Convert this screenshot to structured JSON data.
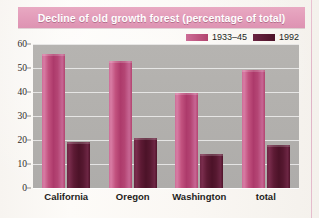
{
  "figure": {
    "title": "Decline of old growth forest (percentage of total)",
    "title_band_color": "#e49ebb",
    "plot_background": "#b3b1ae",
    "page_background": "#faf7f3"
  },
  "legend": {
    "position": "top-right",
    "entries": [
      {
        "label": "1933–45",
        "color": "#b2446f"
      },
      {
        "label": "1992",
        "color": "#4c1228"
      }
    ]
  },
  "axes": {
    "y_ticks": [
      "60",
      "50",
      "40",
      "30",
      "20",
      "10",
      "0"
    ],
    "x_categories": [
      "California",
      "Oregon",
      "Washington",
      "total"
    ]
  },
  "chart_data": {
    "type": "bar",
    "title": "Decline of old growth forest (percentage of total)",
    "xlabel": "",
    "ylabel": "",
    "ylim": [
      0,
      60
    ],
    "ytick_step": 10,
    "grid": true,
    "legend_position": "top-right",
    "categories": [
      "California",
      "Oregon",
      "Washington",
      "total"
    ],
    "series": [
      {
        "name": "1933–45",
        "color": "#b2446f",
        "values": [
          56,
          53,
          39.5,
          49
        ]
      },
      {
        "name": "1992",
        "color": "#4c1228",
        "values": [
          19,
          21,
          14,
          18
        ]
      }
    ]
  }
}
